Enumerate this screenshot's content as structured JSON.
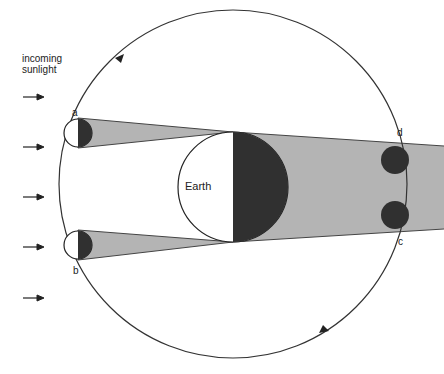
{
  "labels": {
    "sunlight_line1": "incoming",
    "sunlight_line2": "sunlight",
    "earth": "Earth",
    "moon_a": "a",
    "moon_b": "b",
    "moon_c": "c",
    "moon_d": "d"
  },
  "colors": {
    "shadow_fill": "#b4b4b4",
    "dark_fill": "#303030",
    "line": "#222222"
  },
  "sunlight_arrows": [
    {
      "y": 97
    },
    {
      "y": 147
    },
    {
      "y": 197
    },
    {
      "y": 247
    },
    {
      "y": 298
    }
  ]
}
